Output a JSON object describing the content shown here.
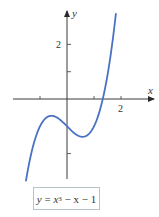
{
  "chart_data": {
    "type": "line",
    "title": "",
    "function": "y = x^3 - x - 1",
    "coefficients": {
      "a3": 1,
      "a2": 0,
      "a1": -1,
      "a0": -1
    },
    "x_range": [
      -1.52,
      1.81
    ],
    "xlabel": "x",
    "ylabel": "y",
    "xlim": [
      -2.0,
      3.2
    ],
    "ylim": [
      -3.0,
      3.3
    ],
    "x_ticks": [
      {
        "value": -1,
        "label": ""
      },
      {
        "value": 1,
        "label": ""
      },
      {
        "value": 2,
        "label": "2"
      }
    ],
    "y_ticks": [
      {
        "value": 1,
        "label": ""
      },
      {
        "value": 2,
        "label": "2"
      },
      {
        "value": -2,
        "label": ""
      }
    ],
    "key_points": [
      {
        "name": "local max",
        "x": -0.577,
        "y": -0.615
      },
      {
        "name": "y-intercept",
        "x": 0,
        "y": -1
      },
      {
        "name": "local min",
        "x": 0.577,
        "y": -1.385
      },
      {
        "name": "x-intercept",
        "x": 1.325,
        "y": 0
      }
    ],
    "grid": false,
    "legend": "none",
    "series_color": "#4a72c4"
  },
  "labels": {
    "x_axis": "x",
    "y_axis": "y",
    "tick_x_2": "2",
    "tick_y_2": "2",
    "equation": {
      "lhs": "y",
      "eq": " = ",
      "var": "x",
      "exp": "3",
      "rest": " − x − 1"
    }
  }
}
